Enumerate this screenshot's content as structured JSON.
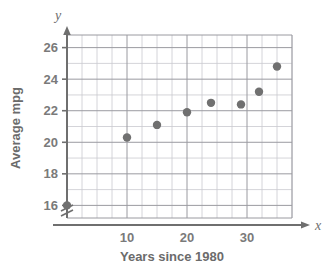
{
  "chart_data": {
    "type": "scatter",
    "title": "",
    "xlabel": "Years since 1980",
    "ylabel": "Average mpg",
    "x_axis_letter": "x",
    "y_axis_letter": "y",
    "xlim": [
      0,
      37.5
    ],
    "ylim": [
      15.2,
      26.8
    ],
    "xticks": [
      10,
      20,
      30
    ],
    "xtick_labels": [
      "10",
      "20",
      "30"
    ],
    "yticks": [
      16,
      18,
      20,
      22,
      24,
      26
    ],
    "ytick_labels": [
      "16",
      "18",
      "20",
      "22",
      "24",
      "26"
    ],
    "x_minor_step": 2.5,
    "y_minor_step": 1,
    "grid": true,
    "legend": "none",
    "y_axis_break": true,
    "points": [
      {
        "x": 0,
        "y": 16.0
      },
      {
        "x": 10,
        "y": 20.3
      },
      {
        "x": 15,
        "y": 21.1
      },
      {
        "x": 20,
        "y": 21.9
      },
      {
        "x": 24,
        "y": 22.5
      },
      {
        "x": 29,
        "y": 22.4
      },
      {
        "x": 32,
        "y": 23.2
      },
      {
        "x": 35,
        "y": 24.8
      }
    ],
    "point_color": "#707070",
    "grid_color": "#9a9aa0",
    "minor_grid_color": "#c9c9cf",
    "axis_color": "#6f6f6f"
  }
}
